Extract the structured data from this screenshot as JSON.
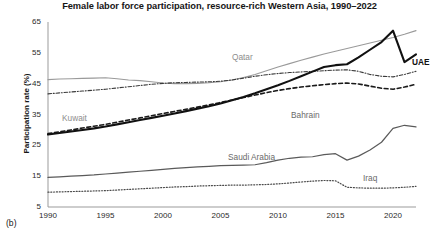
{
  "chart_data": {
    "type": "line",
    "title": "Female labor force participation, resource-rich Western Asia, 1990–2022",
    "panel_label": "(b)",
    "xlabel": "",
    "ylabel": "Participation rate (%)",
    "xlim": [
      1990,
      2022
    ],
    "ylim": [
      5,
      65
    ],
    "xticks": [
      1990,
      1995,
      2000,
      2005,
      2010,
      2015,
      2020
    ],
    "yticks": [
      5,
      15,
      25,
      35,
      45,
      55,
      65
    ],
    "xtick_labels": [
      "1990",
      "1995",
      "2000",
      "2005",
      "2010",
      "2015",
      "2020"
    ],
    "ytick_labels": [
      "5",
      "15",
      "25",
      "35",
      "45",
      "55",
      "65"
    ],
    "grid": false,
    "legend": "inline-labels",
    "x": [
      1990,
      1991,
      1992,
      1993,
      1994,
      1995,
      1996,
      1997,
      1998,
      1999,
      2000,
      2001,
      2002,
      2003,
      2004,
      2005,
      2006,
      2007,
      2008,
      2009,
      2010,
      2011,
      2012,
      2013,
      2014,
      2015,
      2016,
      2017,
      2018,
      2019,
      2020,
      2021,
      2022
    ],
    "series": [
      {
        "name": "Qatar",
        "style": "solid",
        "color": "#9a9a9a",
        "width": 1.1,
        "label_position": {
          "x": 232,
          "y": 52
        },
        "values": [
          46.3,
          46.5,
          46.6,
          46.7,
          46.8,
          46.9,
          46.6,
          46.2,
          46.0,
          45.6,
          45.2,
          45.0,
          45.0,
          45.1,
          45.3,
          45.6,
          46.2,
          47.0,
          48.0,
          49.2,
          50.4,
          51.5,
          52.6,
          53.6,
          54.6,
          55.5,
          56.4,
          57.3,
          58.2,
          59.1,
          60.0,
          61.0,
          62.2
        ]
      },
      {
        "name": "Kuwait",
        "style": "dashdot",
        "color": "#3a3a3a",
        "width": 1.1,
        "label_position": {
          "x": 62,
          "y": 113
        },
        "values": [
          41.7,
          42.0,
          42.3,
          42.6,
          42.9,
          43.2,
          43.6,
          44.0,
          44.4,
          44.8,
          45.1,
          45.3,
          45.4,
          45.5,
          45.6,
          45.8,
          46.2,
          46.8,
          47.4,
          47.9,
          48.3,
          48.6,
          48.8,
          49.0,
          49.2,
          49.4,
          49.5,
          49.0,
          48.0,
          47.4,
          47.2,
          48.0,
          49.0
        ]
      },
      {
        "name": "Bahrain",
        "style": "dashed",
        "color": "#1a1a1a",
        "width": 1.6,
        "label_position": {
          "x": 291,
          "y": 110
        },
        "values": [
          28.8,
          29.4,
          30.0,
          30.6,
          31.2,
          31.8,
          32.5,
          33.2,
          33.9,
          34.6,
          35.3,
          36.0,
          36.7,
          37.4,
          38.1,
          38.9,
          39.7,
          40.5,
          41.3,
          42.1,
          42.8,
          43.4,
          43.9,
          44.3,
          44.7,
          45.0,
          45.2,
          44.9,
          44.2,
          43.5,
          43.2,
          43.9,
          44.8
        ]
      },
      {
        "name": "UAE",
        "style": "solid",
        "color": "#111111",
        "width": 2.1,
        "label_position": {
          "x": 412,
          "y": 57
        },
        "values": [
          28.5,
          29.0,
          29.5,
          30.0,
          30.5,
          31.1,
          31.8,
          32.5,
          33.2,
          33.9,
          34.6,
          35.3,
          36.1,
          36.9,
          37.7,
          38.6,
          39.6,
          40.7,
          41.9,
          43.2,
          44.5,
          45.9,
          47.4,
          48.9,
          50.4,
          51.0,
          51.3,
          53.5,
          56.0,
          58.5,
          62.2,
          52.0,
          54.5
        ]
      },
      {
        "name": "Saudi Arabia",
        "style": "solid",
        "color": "#5a5a5a",
        "width": 1.2,
        "label_position": {
          "x": 228,
          "y": 152
        },
        "values": [
          14.6,
          14.8,
          15.0,
          15.2,
          15.4,
          15.7,
          16.0,
          16.3,
          16.6,
          16.9,
          17.2,
          17.5,
          17.8,
          18.0,
          18.2,
          18.4,
          18.5,
          18.6,
          18.7,
          19.4,
          20.2,
          20.8,
          21.2,
          21.3,
          22.0,
          22.3,
          20.2,
          21.5,
          23.5,
          26.0,
          30.5,
          31.5,
          31.0
        ]
      },
      {
        "name": "Iraq",
        "style": "dotted",
        "color": "#4a4a4a",
        "width": 1.2,
        "label_position": {
          "x": 363,
          "y": 173
        },
        "values": [
          9.8,
          9.9,
          10.0,
          10.1,
          10.2,
          10.3,
          10.5,
          10.7,
          10.9,
          11.1,
          11.3,
          11.5,
          11.6,
          11.8,
          11.9,
          12.0,
          12.1,
          12.1,
          12.2,
          12.3,
          12.5,
          12.8,
          13.1,
          13.4,
          13.6,
          13.5,
          11.4,
          11.2,
          11.1,
          11.1,
          11.2,
          11.4,
          11.7
        ]
      }
    ]
  }
}
